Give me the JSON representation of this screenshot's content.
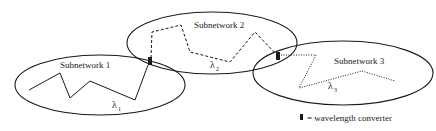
{
  "diagram": {
    "colors": {
      "stroke": "#1a1a1a",
      "background": "#ffffff"
    },
    "subnetworks": [
      {
        "id": 1,
        "label": "Subnetwork 1",
        "wavelength_symbol": "λ",
        "wavelength_index": "1",
        "path_style": "solid"
      },
      {
        "id": 2,
        "label": "Subnetwork 2",
        "wavelength_symbol": "λ",
        "wavelength_index": "2",
        "path_style": "dashed"
      },
      {
        "id": 3,
        "label": "Subnetwork 3",
        "wavelength_symbol": "λ",
        "wavelength_index": "3",
        "path_style": "dotted"
      }
    ],
    "converters": [
      {
        "between": "Subnetwork 1 / Subnetwork 2"
      },
      {
        "between": "Subnetwork 2 / Subnetwork 3"
      }
    ],
    "legend": {
      "icon": "converter-block-icon",
      "text": "= wavelength converter"
    }
  }
}
